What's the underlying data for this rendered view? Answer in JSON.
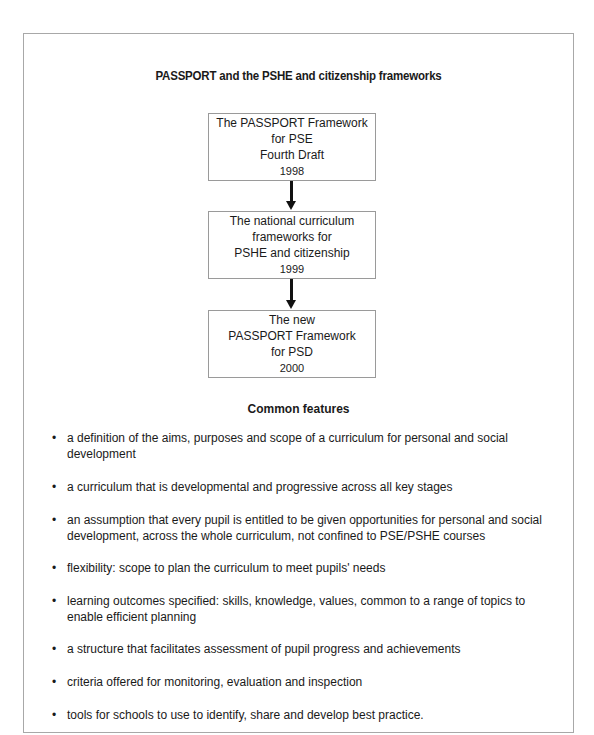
{
  "title": "PASSPORT and the PSHE and citizenship frameworks",
  "flow": {
    "boxes": [
      {
        "lines": [
          "The PASSPORT Framework",
          "for PSE",
          "Fourth Draft"
        ],
        "year": "1998"
      },
      {
        "lines": [
          "The national curriculum",
          "frameworks for",
          "PSHE and citizenship"
        ],
        "year": "1999"
      },
      {
        "lines": [
          "The new",
          "PASSPORT Framework",
          "for PSD"
        ],
        "year": "2000"
      }
    ],
    "arrow_color": "#111111",
    "border_color": "#9a9a9a"
  },
  "common_features": {
    "heading": "Common features",
    "items": [
      "a definition of the aims, purposes and scope of a curriculum for personal and social development",
      "a curriculum that is developmental and progressive across all key stages",
      "an assumption that every pupil is entitled to be given opportunities for personal and social development, across the whole curriculum, not confined to PSE/PSHE courses",
      "flexibility: scope to plan the curriculum to meet pupils' needs",
      "learning outcomes specified: skills, knowledge, values, common to a range of topics to enable efficient planning",
      "a structure that facilitates assessment of pupil progress and achievements",
      "criteria offered for monitoring, evaluation and inspection",
      "tools for schools to use to identify, share and develop best practice."
    ]
  }
}
